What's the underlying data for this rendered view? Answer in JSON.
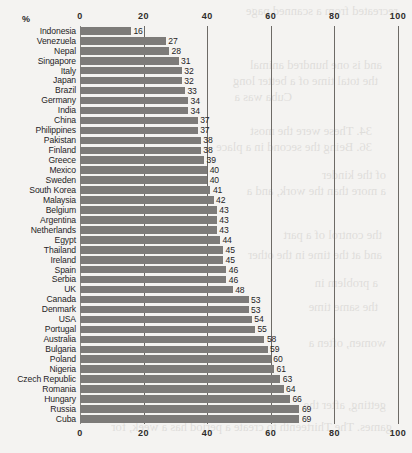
{
  "chart_data": {
    "type": "bar",
    "orientation": "horizontal",
    "title": "",
    "subtitle": "",
    "xlabel": "%",
    "ylabel": "",
    "unit_label": "%",
    "xlim": [
      0,
      100
    ],
    "xticks": [
      0,
      20,
      40,
      60,
      80,
      100
    ],
    "xtick_labels": [
      "0",
      "20",
      "40",
      "60",
      "80",
      "100"
    ],
    "grid": true,
    "gridlines_at": [
      0,
      20,
      40,
      60,
      80,
      100
    ],
    "axis_positions": [
      "top",
      "bottom"
    ],
    "legend": null,
    "value_labels": true,
    "bar_color": "#7d7b79",
    "background_color": "#f4f3f1",
    "categories": [
      "Indonesia",
      "Venezuela",
      "Nepal",
      "Singapore",
      "Italy",
      "Japan",
      "Brazil",
      "Germany",
      "India",
      "China",
      "Philippines",
      "Pakistan",
      "Finland",
      "Greece",
      "Mexico",
      "Sweden",
      "South Korea",
      "Malaysia",
      "Belgium",
      "Argentina",
      "Netherlands",
      "Egypt",
      "Thailand",
      "Ireland",
      "Spain",
      "Serbia",
      "UK",
      "Canada",
      "Denmark",
      "USA",
      "Portugal",
      "Australia",
      "Bulgaria",
      "Poland",
      "Nigeria",
      "Czech Republic",
      "Romania",
      "Hungary",
      "Russia",
      "Cuba"
    ],
    "values": [
      16,
      27,
      28,
      31,
      32,
      32,
      33,
      34,
      34,
      37,
      37,
      38,
      38,
      39,
      40,
      40,
      41,
      42,
      43,
      43,
      43,
      44,
      45,
      45,
      46,
      46,
      48,
      53,
      53,
      54,
      55,
      58,
      59,
      60,
      61,
      63,
      64,
      66,
      69,
      69
    ]
  },
  "page_bleed": [
    "the world's",
    "and in several of the",
    "an entirely",
    "most with",
    "in most of the",
    "a less",
    "in a week",
    "of the nation",
    "as more",
    "in a few",
    "and as",
    "of women"
  ]
}
